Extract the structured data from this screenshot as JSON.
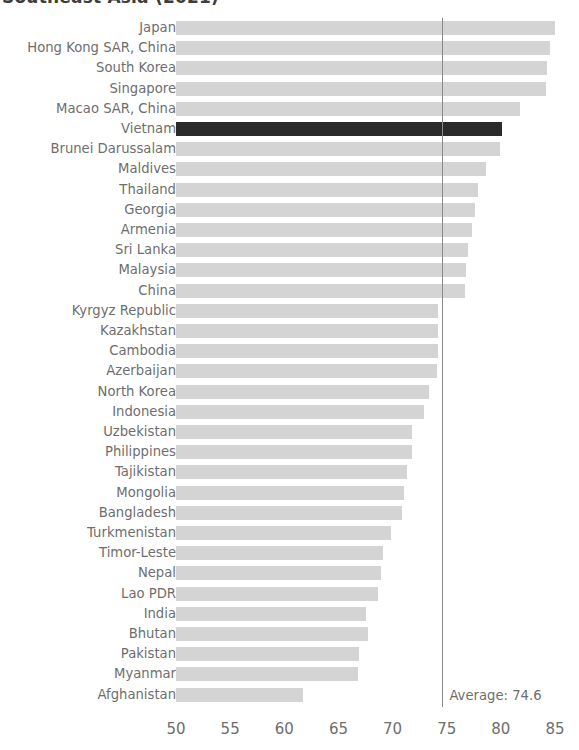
{
  "chart_data": {
    "type": "bar",
    "orientation": "horizontal",
    "title": "Southeast Asia (2021)",
    "xlabel": "",
    "ylabel": "",
    "xlim": [
      50,
      85
    ],
    "xticks": [
      50,
      55,
      60,
      65,
      70,
      75,
      80,
      85
    ],
    "grid": false,
    "legend": null,
    "highlight_category": "Vietnam",
    "colors": {
      "bar": "#d4d4d4",
      "highlight_bar": "#2b2b2b",
      "text": "#6e6e6e",
      "title": "#3d3d3d",
      "average_line": "#8a8a8a",
      "background": "#ffffff"
    },
    "annotations": [
      {
        "name": "average-line",
        "label": "Average: 74.6",
        "value": 74.6
      }
    ],
    "categories": [
      "Japan",
      "Hong Kong SAR, China",
      "South Korea",
      "Singapore",
      "Macao SAR, China",
      "Vietnam",
      "Brunei Darussalam",
      "Maldives",
      "Thailand",
      "Georgia",
      "Armenia",
      "Sri Lanka",
      "Malaysia",
      "China",
      "Kyrgyz Republic",
      "Kazakhstan",
      "Cambodia",
      "Azerbaijan",
      "North Korea",
      "Indonesia",
      "Uzbekistan",
      "Philippines",
      "Tajikistan",
      "Mongolia",
      "Bangladesh",
      "Turkmenistan",
      "Timor-Leste",
      "Nepal",
      "Lao PDR",
      "India",
      "Bhutan",
      "Pakistan",
      "Myanmar",
      "Afghanistan"
    ],
    "values": [
      85.0,
      84.5,
      84.3,
      84.2,
      81.8,
      80.1,
      79.9,
      78.6,
      77.9,
      77.6,
      77.3,
      77.0,
      76.8,
      76.7,
      74.2,
      74.2,
      74.2,
      74.1,
      73.4,
      72.9,
      71.8,
      71.8,
      71.3,
      71.1,
      70.9,
      69.9,
      69.1,
      68.9,
      68.7,
      67.5,
      67.7,
      66.9,
      66.8,
      61.7
    ]
  },
  "axis": {
    "tick_labels": [
      "50",
      "55",
      "60",
      "65",
      "70",
      "75",
      "80",
      "85"
    ]
  },
  "average": {
    "label": "Average: 74.6"
  }
}
